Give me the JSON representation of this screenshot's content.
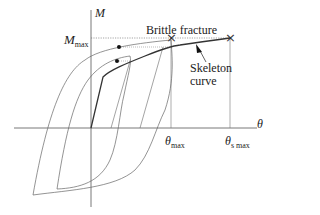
{
  "diagram": {
    "type": "hysteresis moment-rotation diagram",
    "axes": {
      "vertical_label": "M",
      "horizontal_label": "θ"
    },
    "levels": {
      "m_max": {
        "symbol": "M",
        "subscript": "max"
      },
      "theta_max": {
        "symbol": "θ",
        "subscript": "max"
      },
      "theta_s_max": {
        "symbol": "θ",
        "subscript": "s max"
      }
    },
    "annotations": {
      "brittle_fracture": "Brittle fracture",
      "skeleton_curve_line1": "Skeleton",
      "skeleton_curve_line2": "curve"
    },
    "markers": {
      "fracture_marker": "×",
      "end_marker": "×"
    },
    "colors": {
      "line": "#555555",
      "skeleton": "#333333",
      "text": "#222222",
      "background": "#ffffff"
    }
  }
}
